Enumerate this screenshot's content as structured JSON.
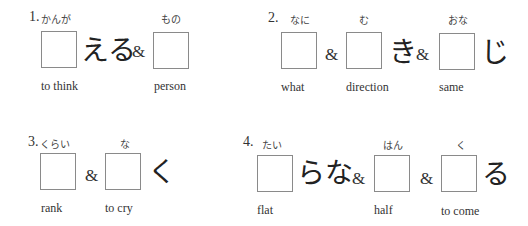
{
  "items": [
    {
      "number": "1.",
      "furigana": [
        "かんが",
        "もの"
      ],
      "kana": [
        "える"
      ],
      "ampersands": [
        "&"
      ],
      "labels": [
        "to think",
        "person"
      ]
    },
    {
      "number": "2.",
      "furigana": [
        "なに",
        "む",
        "おな"
      ],
      "kana": [
        "き",
        "じ"
      ],
      "ampersands": [
        "&",
        "&"
      ],
      "labels": [
        "what",
        "direction",
        "same"
      ]
    },
    {
      "number": "3.",
      "furigana": [
        "くらい",
        "な"
      ],
      "kana": [
        "く"
      ],
      "ampersands": [
        "&"
      ],
      "labels": [
        "rank",
        "to cry"
      ]
    },
    {
      "number": "4.",
      "furigana": [
        "たい",
        "はん",
        "く"
      ],
      "kana": [
        "らな",
        "る"
      ],
      "ampersands": [
        "&",
        "&"
      ],
      "labels": [
        "flat",
        "half",
        "to come"
      ]
    }
  ]
}
